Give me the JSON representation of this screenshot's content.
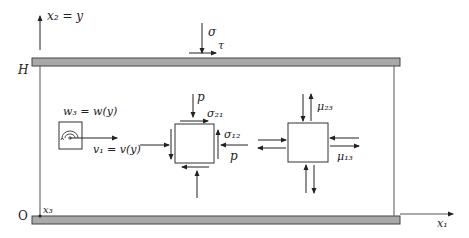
{
  "axes": {
    "vertical_label": "x₂ = y",
    "horizontal_label": "x₁",
    "origin_label": "O",
    "height_label": "H",
    "out_of_plane_label": "x₃"
  },
  "boundary_loads": {
    "normal_label": "σ",
    "shear_label": "τ"
  },
  "microrotation": {
    "label": "w₃ = w(y)"
  },
  "velocity": {
    "label": "v₁ = v(y)"
  },
  "stress_element": {
    "pressure_top_label": "p",
    "pressure_right_label": "p",
    "shear_21_label": "σ₂₁",
    "shear_12_label": "σ₁₂"
  },
  "couple_stress_element": {
    "mu_23_label": "μ₂₃",
    "mu_13_label": "μ₁₃"
  },
  "colors": {
    "plate_fill": "#a9a9a9",
    "plate_edge": "#444444",
    "line": "#222222"
  }
}
